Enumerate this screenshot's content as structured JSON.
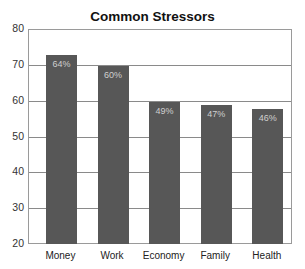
{
  "chart_data": {
    "type": "bar",
    "title": "Common Stressors",
    "xlabel": "",
    "ylabel": "",
    "ylim": [
      20,
      80
    ],
    "yticks": [
      20,
      30,
      40,
      50,
      60,
      70,
      80
    ],
    "grid": true,
    "categories": [
      "Money",
      "Work",
      "Economy",
      "Family",
      "Health"
    ],
    "values": [
      73,
      70,
      60,
      59,
      58
    ],
    "data_labels": [
      "64%",
      "60%",
      "49%",
      "47%",
      "46%"
    ],
    "bar_color": "#575757",
    "label_color": "#cfcfcf"
  }
}
